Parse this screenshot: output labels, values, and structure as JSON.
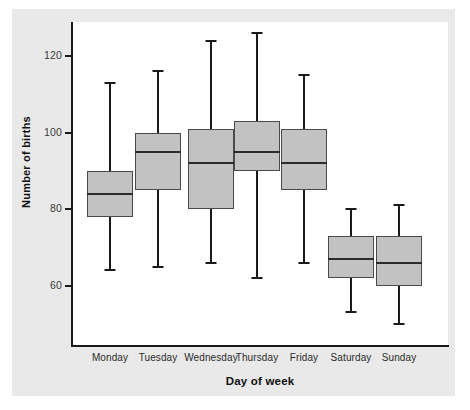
{
  "chart_data": {
    "type": "box",
    "title": "",
    "xlabel": "Day of week",
    "ylabel": "Number of births",
    "xlim_categories": [
      "Monday",
      "Tuesday",
      "Wednesday",
      "Thursday",
      "Friday",
      "Saturday",
      "Sunday"
    ],
    "ylim": [
      48,
      129
    ],
    "yticks": [
      60,
      80,
      100,
      120
    ],
    "ytick_labels": [
      "60",
      "80",
      "100",
      "120"
    ],
    "grid": false,
    "legend": null,
    "box_fill_color": "#c2c2c2",
    "box_edge_color": "#4a4a4a",
    "panel_background": "#e9e9e9",
    "plot_background": "#ffffff",
    "categories": [
      {
        "label": "Monday",
        "whisker_low": 64,
        "q1": 78,
        "median": 84,
        "q3": 90,
        "whisker_high": 113
      },
      {
        "label": "Tuesday",
        "whisker_low": 65,
        "q1": 85,
        "median": 95,
        "q3": 100,
        "whisker_high": 116
      },
      {
        "label": "Wednesday",
        "whisker_low": 66,
        "q1": 80,
        "median": 92,
        "q3": 101,
        "whisker_high": 124
      },
      {
        "label": "Thursday",
        "whisker_low": 62,
        "q1": 90,
        "median": 95,
        "q3": 103,
        "whisker_high": 126
      },
      {
        "label": "Friday",
        "whisker_low": 66,
        "q1": 85,
        "median": 92,
        "q3": 101,
        "whisker_high": 115
      },
      {
        "label": "Saturday",
        "whisker_low": 53,
        "q1": 62,
        "median": 67,
        "q3": 73,
        "whisker_high": 80
      },
      {
        "label": "Sunday",
        "whisker_low": 50,
        "q1": 60,
        "median": 66,
        "q3": 73,
        "whisker_high": 81
      }
    ]
  },
  "geometry": {
    "plot_left": 72,
    "plot_top": 22,
    "plot_width": 376,
    "plot_height": 323,
    "y_value_at_plot_top": 128.9,
    "y_value_at_plot_bottom": 44.5,
    "box_width": 46,
    "category_centers": [
      110,
      158,
      211,
      257,
      304,
      351,
      399
    ]
  }
}
